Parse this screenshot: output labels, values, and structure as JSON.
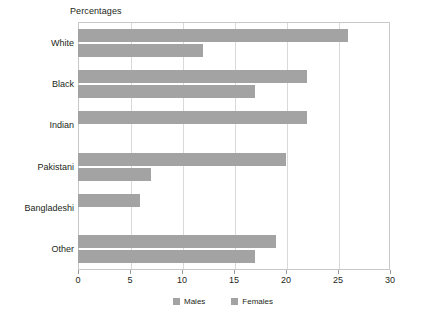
{
  "chart_data": {
    "type": "bar",
    "orientation": "horizontal",
    "title": "Percentages",
    "xlabel": "",
    "ylabel": "",
    "xlim": [
      0,
      30
    ],
    "xticks": [
      0,
      5,
      10,
      15,
      20,
      25,
      30
    ],
    "xtick_labels": [
      "0",
      "5",
      "10",
      "15",
      "20",
      "25",
      "30"
    ],
    "grid": true,
    "grid_axis": "x",
    "legend_position": "bottom",
    "categories": [
      "White",
      "Black",
      "Indian",
      "Pakistani",
      "Bangladeshi",
      "Other"
    ],
    "series": [
      {
        "name": "Males",
        "color": "#a3a3a3",
        "values": [
          26,
          22,
          22,
          20,
          6,
          19
        ]
      },
      {
        "name": "Females",
        "color": "#a3a3a3",
        "values": [
          12,
          17,
          0,
          7,
          0,
          17
        ]
      }
    ]
  },
  "legend": {
    "items": [
      {
        "label": "Males"
      },
      {
        "label": "Females"
      }
    ]
  },
  "colors": {
    "bar": "#a3a3a3",
    "grid": "#d9d9d9",
    "axis": "#c8c8c8",
    "text": "#231f20",
    "background": "#ffffff"
  }
}
